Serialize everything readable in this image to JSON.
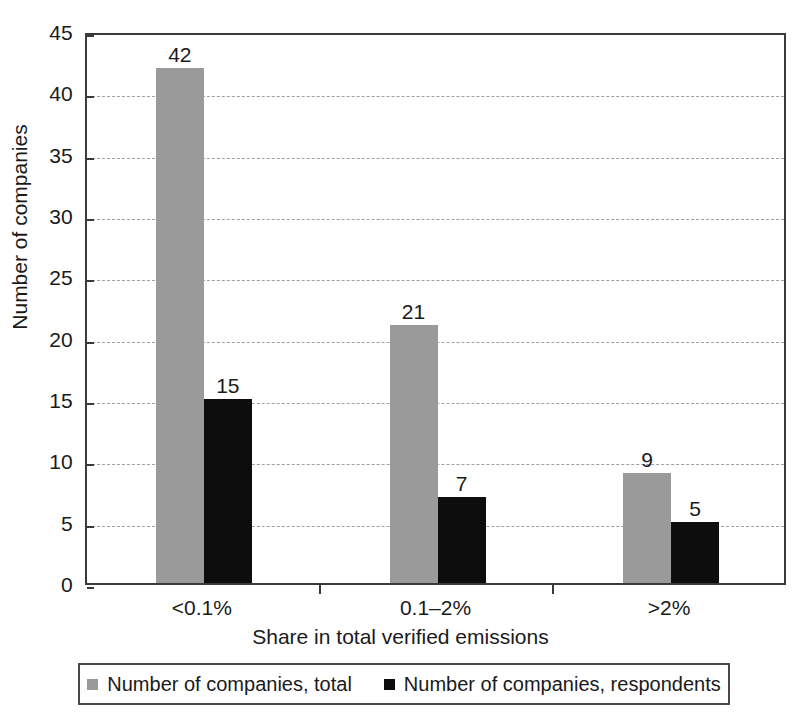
{
  "chart_data": {
    "type": "bar",
    "title": "",
    "xlabel": "Share in total verified emissions",
    "ylabel": "Number of companies",
    "categories": [
      "<0.1%",
      "0.1–2%",
      ">2%"
    ],
    "series": [
      {
        "name": "Number of companies, total",
        "values": [
          42,
          21,
          9
        ],
        "color": "#9a9a9a"
      },
      {
        "name": "Number of companies, respondents",
        "values": [
          15,
          7,
          5
        ],
        "color": "#0d0d0d"
      }
    ],
    "ylim": [
      0,
      45
    ],
    "yticks": [
      0,
      5,
      10,
      15,
      20,
      25,
      30,
      35,
      40,
      45
    ],
    "ytick_labels": [
      "0",
      "5",
      "10",
      "15",
      "20",
      "25",
      "30",
      "35",
      "40",
      "45"
    ],
    "grid": true,
    "grid_axis": "y",
    "grid_style": "dashed",
    "legend_position": "bottom",
    "data_labels": true,
    "data_label_values": [
      [
        "42",
        "15"
      ],
      [
        "21",
        "7"
      ],
      [
        "9",
        "5"
      ]
    ]
  },
  "legend": {
    "entries": [
      {
        "label": "Number of companies, total",
        "swatch": "gray-square-swatch"
      },
      {
        "label": "Number of companies, respondents",
        "swatch": "black-square-swatch"
      }
    ]
  },
  "axes": {
    "x_title": "Share in total verified emissions",
    "y_title": "Number of companies"
  }
}
